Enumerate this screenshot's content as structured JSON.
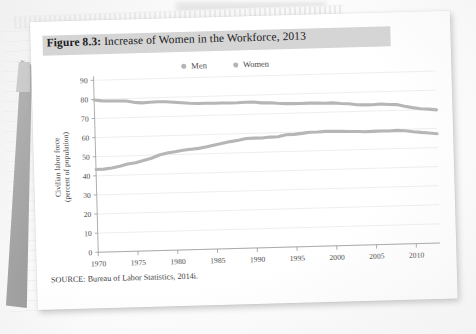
{
  "figure": {
    "title_prefix": "Figure 8.3:",
    "title_rest": " Increase of Women in the Workforce, 2013",
    "source": "SOURCE: Bureau of Labor Statistics, 2014i."
  },
  "colors": {
    "title_band": "#d5d5d5",
    "series_line": "#b6b6b6",
    "gridline": "#e3e3e3",
    "axis": "#9b9b9b",
    "page": "#ffffff"
  },
  "chart_data": {
    "type": "line",
    "title": "Figure 8.3: Increase of Women in the Workforce, 2013",
    "xlabel": "",
    "ylabel": "Civilian labor force (percent of population)",
    "ylabel_line1": "Civilian labor force",
    "ylabel_line2": "(percent of population)",
    "ylim": [
      0,
      90
    ],
    "yticks": [
      0,
      10,
      20,
      30,
      40,
      50,
      60,
      70,
      80,
      90
    ],
    "xlim": [
      1970,
      2013
    ],
    "xticks": [
      1970,
      1975,
      1980,
      1985,
      1990,
      1995,
      2000,
      2005,
      2010
    ],
    "grid": true,
    "legend_position": "top-center",
    "legend": [
      "Men",
      "Women"
    ],
    "x": [
      1970,
      1971,
      1972,
      1973,
      1974,
      1975,
      1976,
      1977,
      1978,
      1979,
      1980,
      1981,
      1982,
      1983,
      1984,
      1985,
      1986,
      1987,
      1988,
      1989,
      1990,
      1991,
      1992,
      1993,
      1994,
      1995,
      1996,
      1997,
      1998,
      1999,
      2000,
      2001,
      2002,
      2003,
      2004,
      2005,
      2006,
      2007,
      2008,
      2009,
      2010,
      2011,
      2012,
      2013
    ],
    "series": [
      {
        "name": "Men",
        "values": [
          79.7,
          79.1,
          78.9,
          78.8,
          78.7,
          77.9,
          77.5,
          77.7,
          77.9,
          77.8,
          77.4,
          77.0,
          76.6,
          76.4,
          76.4,
          76.3,
          76.3,
          76.2,
          76.2,
          76.4,
          76.4,
          75.8,
          75.8,
          75.4,
          75.1,
          75.0,
          74.9,
          75.0,
          74.9,
          74.7,
          74.8,
          74.4,
          74.1,
          73.5,
          73.3,
          73.3,
          73.5,
          73.2,
          73.0,
          72.0,
          71.2,
          70.5,
          70.2,
          69.7
        ]
      },
      {
        "name": "Women",
        "values": [
          43.3,
          43.4,
          43.9,
          44.7,
          45.7,
          46.3,
          47.3,
          48.4,
          50.0,
          50.9,
          51.5,
          52.1,
          52.6,
          52.9,
          53.6,
          54.5,
          55.3,
          56.0,
          56.6,
          57.4,
          57.5,
          57.4,
          57.8,
          57.9,
          58.8,
          58.9,
          59.3,
          59.8,
          59.8,
          60.0,
          59.9,
          59.8,
          59.6,
          59.5,
          59.2,
          59.3,
          59.4,
          59.3,
          59.5,
          59.2,
          58.6,
          58.1,
          57.7,
          57.2
        ]
      }
    ]
  },
  "icons": {
    "legend_marker": "circle-marker-icon"
  }
}
